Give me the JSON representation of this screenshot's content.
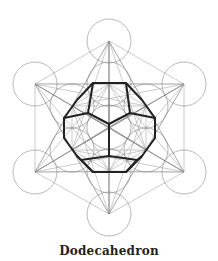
{
  "caption": "Dodecahedron",
  "colors": {
    "thin_line": "#8a8a8a",
    "circle_line": "#8a8a8a",
    "thick_line": "#222222",
    "caption": "#222222"
  },
  "geometry": {
    "circle_radius": 22,
    "nodes": {
      "top": [
        109,
        41
      ],
      "upper_left": [
        35,
        84
      ],
      "upper_right": [
        184,
        84
      ],
      "lower_left": [
        35,
        172
      ],
      "lower_right": [
        184,
        172
      ],
      "bottom": [
        109,
        214
      ],
      "center": [
        109,
        127
      ],
      "inner_top": [
        109,
        84
      ],
      "inner_upper_left": [
        72,
        106
      ],
      "inner_upper_right": [
        146,
        106
      ],
      "inner_lower_left": [
        72,
        150
      ],
      "inner_lower_right": [
        146,
        150
      ],
      "inner_bottom": [
        109,
        171
      ]
    },
    "dodecahedron_outline": [
      [
        93,
        83
      ],
      [
        126,
        83
      ],
      [
        142,
        100
      ],
      [
        155,
        118
      ],
      [
        155,
        138
      ],
      [
        142,
        156
      ],
      [
        126,
        172
      ],
      [
        93,
        172
      ],
      [
        77,
        156
      ],
      [
        64,
        138
      ],
      [
        64,
        118
      ],
      [
        77,
        100
      ]
    ],
    "dodecahedron_inner_edges": [
      [
        [
          109,
          124
        ],
        [
          88,
          113
        ]
      ],
      [
        [
          109,
          124
        ],
        [
          130,
          113
        ]
      ],
      [
        [
          109,
          124
        ],
        [
          109,
          156
        ]
      ],
      [
        [
          88,
          113
        ],
        [
          93,
          83
        ]
      ],
      [
        [
          130,
          113
        ],
        [
          126,
          83
        ]
      ],
      [
        [
          88,
          113
        ],
        [
          64,
          118
        ]
      ],
      [
        [
          130,
          113
        ],
        [
          155,
          118
        ]
      ],
      [
        [
          109,
          156
        ],
        [
          81,
          160
        ]
      ],
      [
        [
          109,
          156
        ],
        [
          137,
          160
        ]
      ],
      [
        [
          81,
          160
        ],
        [
          77,
          156
        ]
      ],
      [
        [
          137,
          160
        ],
        [
          142,
          156
        ]
      ],
      [
        [
          81,
          160
        ],
        [
          93,
          172
        ]
      ],
      [
        [
          137,
          160
        ],
        [
          126,
          172
        ]
      ]
    ]
  }
}
